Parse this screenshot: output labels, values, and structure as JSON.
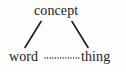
{
  "diagram": {
    "background_color": "#fefefe",
    "ink_color": "#1a1a1a",
    "nodes": [
      {
        "id": "concept",
        "label": "concept",
        "x": 62,
        "y": 12
      },
      {
        "id": "word",
        "label": "word",
        "x": 26,
        "y": 58
      },
      {
        "id": "thing",
        "label": "thing",
        "x": 99,
        "y": 58
      }
    ],
    "edges": [
      {
        "id": "concept-word",
        "from": "concept",
        "to": "word",
        "style": "solid",
        "label": ""
      },
      {
        "id": "concept-thing",
        "from": "concept",
        "to": "thing",
        "style": "solid",
        "label": ""
      },
      {
        "id": "word-thing",
        "from": "word",
        "to": "thing",
        "style": "dotted",
        "label": ""
      }
    ]
  }
}
